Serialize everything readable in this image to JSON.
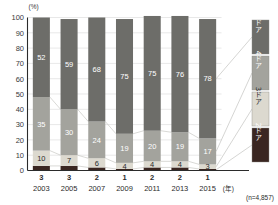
{
  "chart_data": {
    "type": "bar",
    "stacked": true,
    "stack_mode": "percent",
    "title": "",
    "subtitle": "",
    "xlabel": "(年)",
    "ylabel": "",
    "yunit": "(%)",
    "ylim": [
      0,
      100
    ],
    "ytick_step": 10,
    "yticks": [
      "0",
      "10",
      "20",
      "30",
      "40",
      "50",
      "60",
      "70",
      "80",
      "90",
      "100"
    ],
    "grid": true,
    "grid_axis": "y",
    "legend_position": "right-outside",
    "categories": [
      "2003",
      "2005",
      "2007",
      "2009",
      "2011",
      "2013",
      "2015"
    ],
    "series": [
      {
        "name": "2ドア",
        "values": [
          3,
          3,
          2,
          1,
          2,
          2,
          1
        ],
        "color": "#3a2621"
      },
      {
        "name": "3ドア",
        "values": [
          10,
          7,
          6,
          4,
          4,
          4,
          3
        ],
        "color": "#dcd9cf"
      },
      {
        "name": "4ドア",
        "values": [
          35,
          30,
          24,
          19,
          20,
          19,
          17
        ],
        "color": "#a3a39d"
      },
      {
        "name": "5ドア",
        "values": [
          52,
          59,
          68,
          75,
          75,
          76,
          78
        ],
        "color": "#6d6d69"
      }
    ],
    "annotations": {
      "sample_size": "(n=4,857)"
    }
  },
  "legend": {
    "items": [
      {
        "label": "5ドア",
        "color": "#6d6d69",
        "text_on": "dark"
      },
      {
        "label": "4ドア",
        "color": "#a3a39d",
        "text_on": "dark"
      },
      {
        "label": "3ドア",
        "color": "#dcd9cf",
        "text_on": "light"
      },
      {
        "label": "2ドア",
        "color": "#3a2621",
        "text_on": "dark"
      }
    ]
  }
}
